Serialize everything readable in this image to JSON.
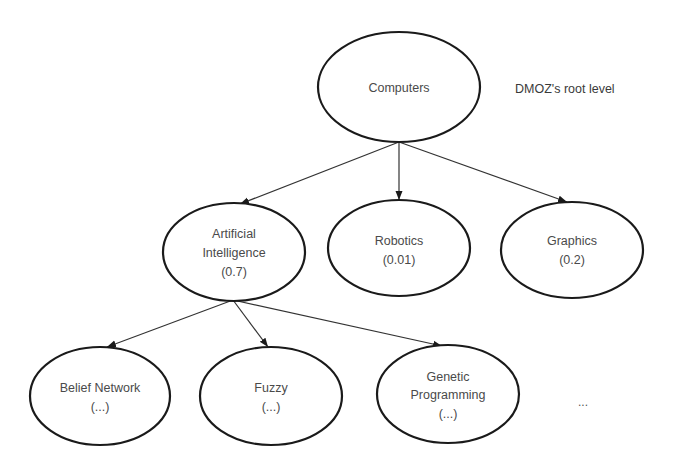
{
  "diagram": {
    "type": "tree",
    "annotation": "DMOZ's root level",
    "root": {
      "id": "computers",
      "label": "Computers"
    },
    "level1": [
      {
        "id": "ai",
        "line1": "Artificial",
        "line2": "Intelligence",
        "score": "(0.7)"
      },
      {
        "id": "robotics",
        "line1": "Robotics",
        "score": "(0.01)"
      },
      {
        "id": "graphics",
        "line1": "Graphics",
        "score": "(0.2)"
      }
    ],
    "level2": [
      {
        "id": "belief-network",
        "line1": "Belief Network",
        "score": "(...)"
      },
      {
        "id": "fuzzy",
        "line1": "Fuzzy",
        "score": "(...)"
      },
      {
        "id": "genetic-programming",
        "line1": "Genetic",
        "line2": "Programming",
        "score": "(...)"
      }
    ],
    "more_indicator": "...",
    "edges": [
      {
        "from": "Computers",
        "to": "Artificial Intelligence"
      },
      {
        "from": "Computers",
        "to": "Robotics"
      },
      {
        "from": "Computers",
        "to": "Graphics"
      },
      {
        "from": "Artificial Intelligence",
        "to": "Belief Network"
      },
      {
        "from": "Artificial Intelligence",
        "to": "Fuzzy"
      },
      {
        "from": "Artificial Intelligence",
        "to": "Genetic Programming"
      }
    ]
  }
}
